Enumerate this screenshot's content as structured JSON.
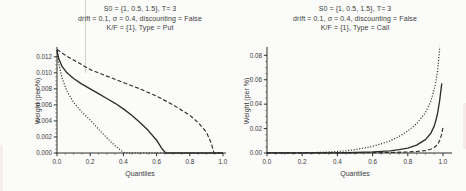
{
  "colors": {
    "ink": "#2d2d2d",
    "text": "#3c3c3c",
    "background": "#fbfbf9",
    "scan_artifact_line": "#919191"
  },
  "chart_data": [
    {
      "type": "line",
      "title_lines": [
        "S0 = {1, 0.5, 1.5}, T= 3",
        "drift = 0.1, σ = 0.4, discounting = False",
        "K/F = {1}, Type = Put"
      ],
      "xlabel": "Quantiles",
      "ylabel": "Weight (per %)",
      "xlim": [
        0,
        1
      ],
      "ylim": [
        0,
        0.0131
      ],
      "x_ticks": [
        0,
        0.2,
        0.4,
        0.6,
        0.8,
        1.0
      ],
      "x_tick_labels": [
        "0.0",
        "0.2",
        "0.4",
        "0.6",
        "0.8",
        "1.0"
      ],
      "y_ticks": [
        0,
        0.002,
        0.004,
        0.006,
        0.008,
        0.01,
        0.012
      ],
      "y_tick_labels": [
        "0.000",
        "0.002",
        "0.004",
        "0.006",
        "0.008",
        "0.010",
        "0.012"
      ],
      "grid": false,
      "legend": "none",
      "series": [
        {
          "name": "solid",
          "style": "solid",
          "points": [
            [
              0,
              0.0128
            ],
            [
              0.01,
              0.0118
            ],
            [
              0.03,
              0.0108
            ],
            [
              0.06,
              0.01
            ],
            [
              0.1,
              0.0093
            ],
            [
              0.15,
              0.0086
            ],
            [
              0.2,
              0.008
            ],
            [
              0.25,
              0.0074
            ],
            [
              0.3,
              0.0068
            ],
            [
              0.35,
              0.0062
            ],
            [
              0.4,
              0.0055
            ],
            [
              0.45,
              0.0047
            ],
            [
              0.5,
              0.0038
            ],
            [
              0.55,
              0.0028
            ],
            [
              0.6,
              0.0016
            ],
            [
              0.63,
              0.0006
            ],
            [
              0.655,
              0
            ],
            [
              1.0,
              0
            ]
          ]
        },
        {
          "name": "dotted",
          "style": "dotted",
          "points": [
            [
              0,
              0.0128
            ],
            [
              0.01,
              0.0112
            ],
            [
              0.03,
              0.0094
            ],
            [
              0.06,
              0.0077
            ],
            [
              0.1,
              0.0063
            ],
            [
              0.15,
              0.0051
            ],
            [
              0.2,
              0.0041
            ],
            [
              0.25,
              0.003
            ],
            [
              0.3,
              0.0019
            ],
            [
              0.35,
              0.0009
            ],
            [
              0.4,
              0.0001
            ],
            [
              0.42,
              0
            ],
            [
              0.66,
              0
            ]
          ]
        },
        {
          "name": "dashed",
          "style": "dashed",
          "points": [
            [
              0,
              0.0129
            ],
            [
              0.05,
              0.0122
            ],
            [
              0.1,
              0.0116
            ],
            [
              0.2,
              0.0104
            ],
            [
              0.3,
              0.0096
            ],
            [
              0.4,
              0.0088
            ],
            [
              0.5,
              0.008
            ],
            [
              0.6,
              0.0071
            ],
            [
              0.7,
              0.006
            ],
            [
              0.8,
              0.0047
            ],
            [
              0.85,
              0.0038
            ],
            [
              0.9,
              0.0026
            ],
            [
              0.93,
              0.0012
            ],
            [
              0.945,
              0
            ],
            [
              1.0,
              0
            ]
          ]
        }
      ]
    },
    {
      "type": "line",
      "title_lines": [
        "S0 = {1, 0.5, 1.5}, T= 3",
        "drift = 0.1, σ = 0.4, discounting = False",
        "K/F = {1}, Type = Call"
      ],
      "xlabel": "Quantiles",
      "ylabel": "Weight (per %)",
      "xlim": [
        0,
        1
      ],
      "ylim": [
        0,
        0.086
      ],
      "x_ticks": [
        0,
        0.2,
        0.4,
        0.6,
        0.8,
        1.0
      ],
      "x_tick_labels": [
        "0.0",
        "0.2",
        "0.4",
        "0.6",
        "0.8",
        "1.0"
      ],
      "y_ticks": [
        0,
        0.02,
        0.04,
        0.06,
        0.08
      ],
      "y_tick_labels": [
        "0.00",
        "0.02",
        "0.04",
        "0.06",
        "0.08"
      ],
      "grid": false,
      "legend": "none",
      "series": [
        {
          "name": "dotted",
          "style": "dotted",
          "points": [
            [
              0,
              0.0001
            ],
            [
              0.2,
              0.0002
            ],
            [
              0.3,
              0.0005
            ],
            [
              0.4,
              0.0012
            ],
            [
              0.45,
              0.0018
            ],
            [
              0.5,
              0.0028
            ],
            [
              0.55,
              0.004
            ],
            [
              0.6,
              0.0055
            ],
            [
              0.65,
              0.0075
            ],
            [
              0.7,
              0.01
            ],
            [
              0.75,
              0.0135
            ],
            [
              0.8,
              0.018
            ],
            [
              0.85,
              0.024
            ],
            [
              0.9,
              0.033
            ],
            [
              0.93,
              0.042
            ],
            [
              0.95,
              0.052
            ],
            [
              0.96,
              0.059
            ],
            [
              0.97,
              0.068
            ],
            [
              0.975,
              0.076
            ],
            [
              0.982,
              0.087
            ]
          ]
        },
        {
          "name": "solid",
          "style": "solid",
          "points": [
            [
              0,
              0.0001
            ],
            [
              0.4,
              0.0002
            ],
            [
              0.5,
              0.0004
            ],
            [
              0.6,
              0.0009
            ],
            [
              0.7,
              0.0018
            ],
            [
              0.75,
              0.0028
            ],
            [
              0.8,
              0.004
            ],
            [
              0.85,
              0.0065
            ],
            [
              0.9,
              0.011
            ],
            [
              0.93,
              0.016
            ],
            [
              0.95,
              0.022
            ],
            [
              0.96,
              0.027
            ],
            [
              0.97,
              0.033
            ],
            [
              0.98,
              0.042
            ],
            [
              0.99,
              0.053
            ],
            [
              0.993,
              0.057
            ]
          ]
        },
        {
          "name": "dashed",
          "style": "dashed",
          "points": [
            [
              0,
              0.0001
            ],
            [
              0.5,
              0.0002
            ],
            [
              0.7,
              0.0004
            ],
            [
              0.8,
              0.0008
            ],
            [
              0.85,
              0.0012
            ],
            [
              0.9,
              0.002
            ],
            [
              0.93,
              0.003
            ],
            [
              0.95,
              0.0045
            ],
            [
              0.97,
              0.007
            ],
            [
              0.98,
              0.01
            ],
            [
              0.99,
              0.014
            ],
            [
              1.0,
              0.021
            ]
          ]
        }
      ]
    }
  ]
}
